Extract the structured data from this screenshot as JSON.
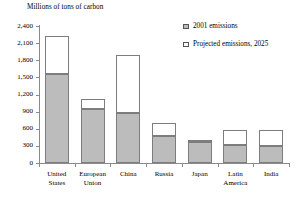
{
  "chart_data": {
    "type": "bar",
    "subtype": "stacked",
    "title": "",
    "ylabel": "Millions of tons of carbon",
    "xlabel": "",
    "ylim": [
      0,
      2400
    ],
    "yticks": [
      0,
      300,
      600,
      900,
      1200,
      1500,
      1800,
      2100,
      2400
    ],
    "ytick_labels": [
      "0",
      "300",
      "600",
      "900",
      "1,200",
      "1,500",
      "1,800",
      "2,100",
      "2,400"
    ],
    "grid": false,
    "legend_position": "upper-right-inside",
    "categories": [
      "United States",
      "European Union",
      "China",
      "Russia",
      "Japan",
      "Latin America",
      "India"
    ],
    "category_lines": [
      [
        "United",
        "States"
      ],
      [
        "European",
        "Union"
      ],
      [
        "China"
      ],
      [
        "Russia"
      ],
      [
        "Japan"
      ],
      [
        "Latin",
        "America"
      ],
      [
        "India"
      ]
    ],
    "series": [
      {
        "name": "2001 emissions",
        "style": "filled-gray",
        "color": "#bcbcbc",
        "values": [
          1560,
          950,
          870,
          470,
          360,
          310,
          305
        ]
      },
      {
        "name": "Projected emissions, 2025",
        "style": "hollow-white",
        "color": "#ffffff",
        "values": [
          2220,
          1120,
          1890,
          700,
          390,
          570,
          570
        ],
        "note": "values are cumulative bar totals; stacked increment above 2001"
      }
    ]
  },
  "legend": {
    "items": [
      {
        "label": "2001 emissions",
        "swatch": "filled"
      },
      {
        "label": "Projected emissions, 2025",
        "swatch": "hollow"
      }
    ]
  },
  "colors": {
    "bar_fill_2001": "#bcbcbc",
    "bar_fill_projected": "#ffffff",
    "bar_border": "#7d7d7d",
    "axis": "#8a8a8a",
    "text": "#000000",
    "background": "#ffffff"
  }
}
